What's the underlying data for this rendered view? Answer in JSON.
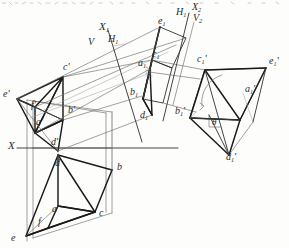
{
  "figure": {
    "background_color": "#fdfdfc",
    "ink_color": "#2b2b2b",
    "line_color_heavy": "#1a1a1a",
    "line_color_light": "#8f8f8f"
  },
  "axes": [
    {
      "id": "x-axis",
      "label": "X",
      "x": 8,
      "y": 147,
      "note": "principal ground line, horizontal"
    },
    {
      "id": "x1-axis",
      "label": "X",
      "sub": "1",
      "x": 99,
      "y": 28
    },
    {
      "id": "v-label",
      "label": "V",
      "x": 88,
      "y": 44
    },
    {
      "id": "h1-label",
      "label": "H",
      "sub": "1",
      "x": 108,
      "y": 41
    },
    {
      "id": "x2-axis",
      "label": "X",
      "sub": "2",
      "x": 192,
      "y": 9
    },
    {
      "id": "h1b-label",
      "label": "H",
      "sub": "1",
      "x": 176,
      "y": 14
    },
    {
      "id": "v2-label",
      "label": "V",
      "sub": "2",
      "x": 193,
      "y": 20
    }
  ],
  "points": [
    {
      "id": "e-prime",
      "label": "e",
      "prime": "'",
      "x": 9,
      "y": 96
    },
    {
      "id": "f-prime",
      "label": "f",
      "prime": "'",
      "x": 31,
      "y": 101
    },
    {
      "id": "c-prime",
      "label": "c",
      "prime": "'",
      "x": 66,
      "y": 71
    },
    {
      "id": "a-prime",
      "label": "a",
      "prime": "'",
      "x": 43,
      "y": 124
    },
    {
      "id": "b-prime",
      "label": "b",
      "prime": "'",
      "x": 75,
      "y": 112
    },
    {
      "id": "d-prime",
      "label": "d",
      "prime": "'",
      "x": 55,
      "y": 146
    },
    {
      "id": "d-plan",
      "label": "d",
      "prime": "",
      "x": 57,
      "y": 166
    },
    {
      "id": "a-plan",
      "label": "a",
      "prime": "",
      "x": 54,
      "y": 211
    },
    {
      "id": "b-plan",
      "label": "b",
      "prime": "",
      "x": 117,
      "y": 170
    },
    {
      "id": "c-plan",
      "label": "c",
      "prime": "",
      "x": 99,
      "y": 215
    },
    {
      "id": "f-plan",
      "label": "f",
      "prime": "",
      "x": 39,
      "y": 224
    },
    {
      "id": "e-plan",
      "label": "e",
      "prime": "",
      "x": 14,
      "y": 240
    },
    {
      "id": "e1",
      "label": "e",
      "sub": "1",
      "prime": "",
      "x": 161,
      "y": 23
    },
    {
      "id": "c1",
      "label": "c",
      "sub": "1",
      "prime": "",
      "x": 155,
      "y": 56
    },
    {
      "id": "a1",
      "label": "a",
      "sub": "1",
      "prime": "",
      "x": 143,
      "y": 65
    },
    {
      "id": "b1",
      "label": "b",
      "sub": "1",
      "prime": "",
      "x": 133,
      "y": 94
    },
    {
      "id": "d1",
      "label": "d",
      "sub": "1",
      "prime": "",
      "x": 143,
      "y": 117
    },
    {
      "id": "c1-prime",
      "label": "c",
      "sub": "1",
      "prime": "'",
      "x": 200,
      "y": 62
    },
    {
      "id": "e1-prime",
      "label": "e",
      "sub": "1",
      "prime": "'",
      "x": 272,
      "y": 63
    },
    {
      "id": "a1-prime",
      "label": "a",
      "sub": "1",
      "prime": "'",
      "x": 248,
      "y": 91
    },
    {
      "id": "b1-prime",
      "label": "b",
      "sub": "1",
      "prime": "'",
      "x": 178,
      "y": 113
    },
    {
      "id": "d1-prime",
      "label": "d",
      "sub": "1",
      "prime": "'",
      "x": 229,
      "y": 160
    }
  ],
  "annotations": [
    {
      "id": "theta-angle",
      "label": "θ",
      "x": 213,
      "y": 128,
      "description": "angle theta between line and auxiliary plane, with right-angle tick"
    }
  ],
  "legend": {
    "description": "Scanned textbook figure: frontal view (upper-left), horizontal plan view (lower-left), first auxiliary view (center), second auxiliary view (right)."
  }
}
